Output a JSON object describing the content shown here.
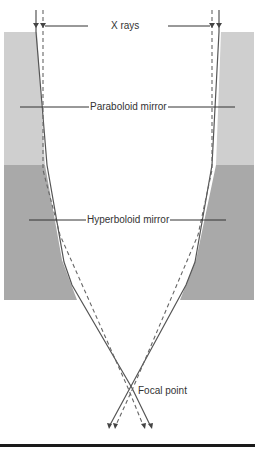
{
  "diagram": {
    "labels": {
      "xrays": "X rays",
      "paraboloid": "Paraboloid mirror",
      "hyperboloid": "Hyperboloid mirror",
      "focal_point": "Focal point"
    },
    "colors": {
      "paraboloid_fill": "#cfcfcf",
      "hyperboloid_fill": "#a9a9a9",
      "ray_solid": "#555555",
      "ray_dashed": "#666666",
      "leader_line": "#333333",
      "bottom_bar": "#1a1a1a"
    }
  }
}
